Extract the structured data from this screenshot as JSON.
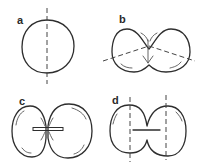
{
  "figure": {
    "colors": {
      "stroke": "#2e2e2e",
      "background": "#ffffff"
    },
    "panels": [
      {
        "id": "a",
        "label": "a",
        "shape": "single round cell",
        "axis": "vertical dashed axis"
      },
      {
        "id": "b",
        "label": "b",
        "shape": "two-lobed cell with shallow furrow",
        "axis": "oblique dashed lines crossing, arrow downward"
      },
      {
        "id": "c",
        "label": "c",
        "shape": "two rounded cells with horizontal junction bar",
        "axis": "none"
      },
      {
        "id": "d",
        "label": "d",
        "shape": "two cells joined with horizontal bar",
        "axis": "two vertical dashed axes"
      }
    ]
  }
}
